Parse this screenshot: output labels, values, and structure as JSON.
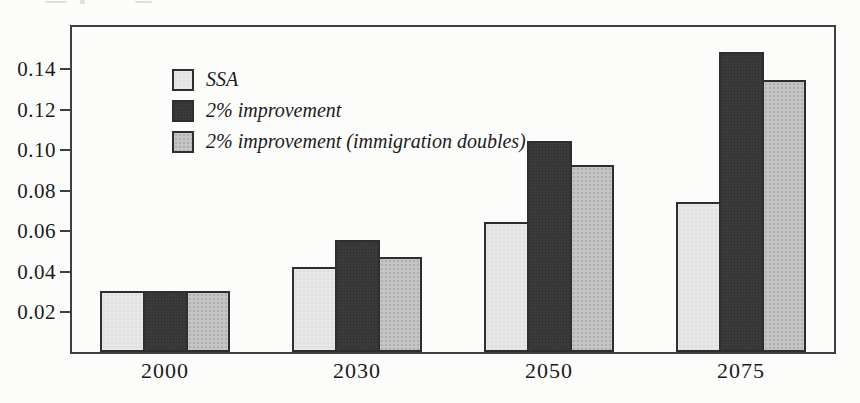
{
  "figure": {
    "background": "#fcfcfb",
    "frame_color": "#3f3f3f",
    "bar_border_color": "#2e2e2e",
    "text_color": "#1b1b1b"
  },
  "chart_data": {
    "type": "bar",
    "title": "",
    "xlabel": "",
    "ylabel": "",
    "categories": [
      "2000",
      "2030",
      "2050",
      "2075"
    ],
    "series": [
      {
        "name": "SSA",
        "color": "#e7e7e7",
        "values": [
          0.03,
          0.042,
          0.064,
          0.074
        ]
      },
      {
        "name": "2% improvement",
        "color": "#3a3a3a",
        "values": [
          0.03,
          0.055,
          0.104,
          0.148
        ]
      },
      {
        "name": "2% improvement (immigration doubles)",
        "color": "#c5c5c5",
        "values": [
          0.03,
          0.047,
          0.092,
          0.134
        ]
      }
    ],
    "ylim": [
      0,
      0.161
    ],
    "yticks": [
      0.02,
      0.04,
      0.06,
      0.08,
      0.1,
      0.12,
      0.14
    ],
    "ytick_labels": [
      "0.02",
      "0.04",
      "0.06",
      "0.08",
      "0.10",
      "0.12",
      "0.14"
    ],
    "grid": false,
    "legend_position": "top-left"
  }
}
